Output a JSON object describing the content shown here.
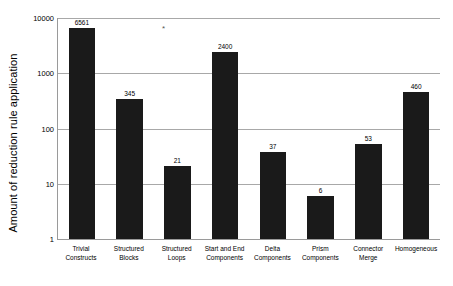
{
  "chart_data": {
    "type": "bar",
    "title": "",
    "xlabel": "",
    "ylabel": "Amount of reduction rule application",
    "yscale": "log",
    "ylim": [
      1,
      10000
    ],
    "ytick_labels": [
      "10000",
      "1000",
      "100",
      "10",
      "1"
    ],
    "ytick_values": [
      10000,
      1000,
      100,
      10,
      1
    ],
    "grid": true,
    "legend": false,
    "bar_color": "#1a1a1a",
    "categories": [
      "Trivial Constructs",
      "Structured Blocks",
      "Structured Loops",
      "Start and End Components",
      "Delta Components",
      "Prism Components",
      "Connector Merge",
      "Homogeneous"
    ],
    "category_lines": [
      [
        "Trivial",
        "Constructs"
      ],
      [
        "Structured",
        "Blocks"
      ],
      [
        "Structured",
        "Loops"
      ],
      [
        "Start and End",
        "Components"
      ],
      [
        "Delta",
        "Components"
      ],
      [
        "Prism",
        "Components"
      ],
      [
        "Connector",
        "Merge"
      ],
      [
        "Homogeneous"
      ]
    ],
    "values": [
      6561,
      345,
      21,
      2400,
      37,
      6,
      53,
      460
    ],
    "value_labels": [
      "6561",
      "345",
      "21",
      "2400",
      "37",
      "6",
      "53",
      "460"
    ],
    "annotations": [
      {
        "text": "*",
        "near_category": "Structured Loops"
      }
    ]
  }
}
